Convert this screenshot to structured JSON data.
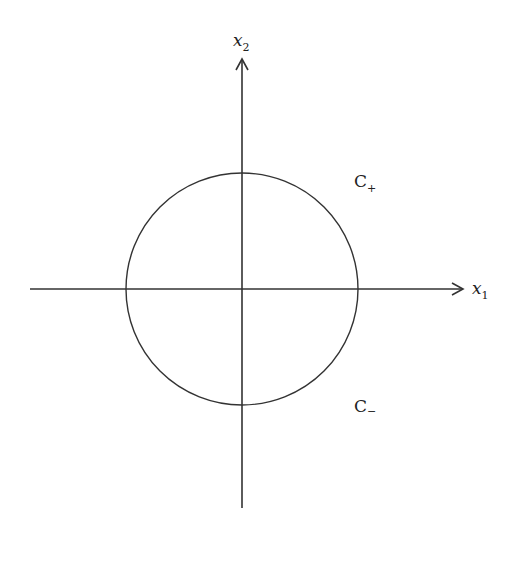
{
  "diagram": {
    "axes": {
      "x_label": {
        "base": "x",
        "sub": "1"
      },
      "y_label": {
        "base": "x",
        "sub": "2"
      }
    },
    "circle": {
      "cx": 242,
      "cy": 289,
      "r": 116
    },
    "regions": [
      {
        "name": "outside-upper",
        "base": "C",
        "sub": "+"
      },
      {
        "name": "outside-lower",
        "base": "C",
        "sub": "−"
      }
    ],
    "colors": {
      "stroke": "#333333",
      "text": "#222222",
      "background": "#ffffff"
    }
  }
}
